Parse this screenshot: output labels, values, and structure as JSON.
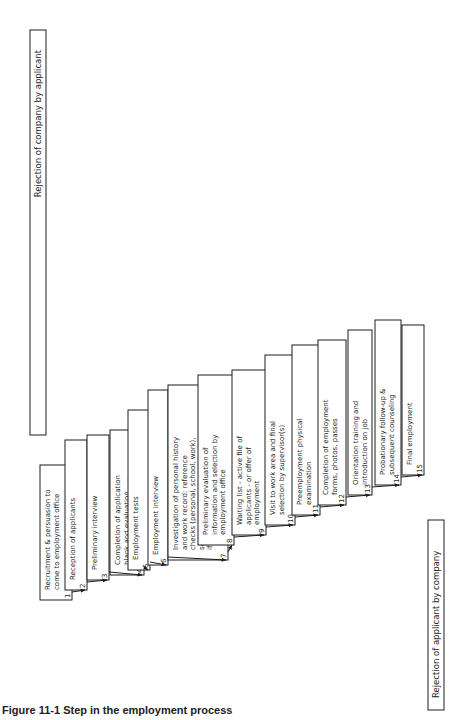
{
  "applicant_rejection_label": "Rejection of company by applicant",
  "company_rejection_label": "Rejection of applicant by company",
  "caption": "Figure 11-1 Step in the employment process",
  "steps": [
    {
      "n": "1",
      "label": [
        "Recruitment & persuasion to",
        "come to employment office"
      ]
    },
    {
      "n": "2",
      "label": [
        "Reception of applicants"
      ]
    },
    {
      "n": "3",
      "label": [
        "Preliminary interview"
      ]
    },
    {
      "n": "4",
      "label": [
        "Completion of application",
        "blank and evaluation"
      ]
    },
    {
      "n": "5",
      "label": [
        "Employment tests"
      ]
    },
    {
      "n": "6",
      "label": [
        "Employment interview"
      ]
    },
    {
      "n": "7",
      "label": [
        "Investigation of personal history",
        "and work record: reference",
        "checks (personal, school, work),",
        "security check (fingerprinting",
        "if required), home visit"
      ]
    },
    {
      "n": "8",
      "label": [
        "Preliminary evaluation of",
        "information and selection by",
        "employment office"
      ]
    },
    {
      "n": "9",
      "label": [
        "Waiting list - active file of",
        "applicants - or offer of",
        "employment"
      ]
    },
    {
      "n": "10",
      "label": [
        "Visit to work area and final",
        "selection by supervisor(s)"
      ]
    },
    {
      "n": "11",
      "label": [
        "Preemployment physical",
        "examination"
      ]
    },
    {
      "n": "12",
      "label": [
        "Completion of employment",
        "forms, photos, passes"
      ]
    },
    {
      "n": "13",
      "label": [
        "Orientation training and",
        "introduction on job"
      ]
    },
    {
      "n": "14",
      "label": [
        "Probationary follow-up &",
        "subsequent counseling"
      ]
    },
    {
      "n": "15",
      "label": [
        "Final employment"
      ]
    }
  ],
  "applicant_reasons": [
    [
      "Disinterest in company opportunity"
    ],
    [
      "Unfavorable impression of company or self-disqualification (cf. citizens only)"
    ],
    [
      "Unfavorable impression of job opportunity. Refusal to wait for interview"
    ],
    [
      "Refusal to complete blank or self-disqualification because of content or",
      "conditions"
    ],
    [
      "Refusal to take tests, self-disqualification by answers"
    ],
    [
      "Unsatisfactory information about company or job. Dislike of interviewer"
    ],
    [
      "Inability to give references, clear security"
    ],
    [
      "Refusal of offer immediately or when called"
    ],
    [
      "Unfavorable impression of work area and supervision"
    ],
    [
      "Refusal to be examined or to sign waivers"
    ],
    [
      "Discovery of unfavorable considerations, such as wages,",
      "rate below expectancy or union shop"
    ],
    [
      "Decision that job or company is unsatisfactory or not",
      "worth coming to work for"
    ],
    [
      "Sense of job failure, inability to \"fit in\", disappointment in",
      "actual job assignment, personal or transportation problems."
    ],
    [
      "Continuation (or reversal) of prior decision to leave company"
    ]
  ],
  "company_reasons": [
    [
      "Employment office not convenient, no interviewer or opening available, no help wanted sign, etc."
    ],
    [
      "Obviously physically unfit or unqualified"
    ],
    [
      "Unfavorable or illegal background"
    ],
    [
      "Unfavorable test scores"
    ],
    [
      "Unacceptable general impression, health history, education, experience, personal",
      "qualities or background"
    ],
    [
      "Unfavorable references or personal data (time delay)"
    ],
    [
      "Negative total evaluation in light of company policies"
    ],
    [
      "Refusal by foreman or supervisor"
    ],
    [
      "Not physically fit for job or",
      "company insurance"
    ],
    [
      "Discovery of unfavorable data",
      "not considered in prior evaluation"
    ],
    [
      "Failure in initial job assignment",
      "or reassignment"
    ]
  ]
}
